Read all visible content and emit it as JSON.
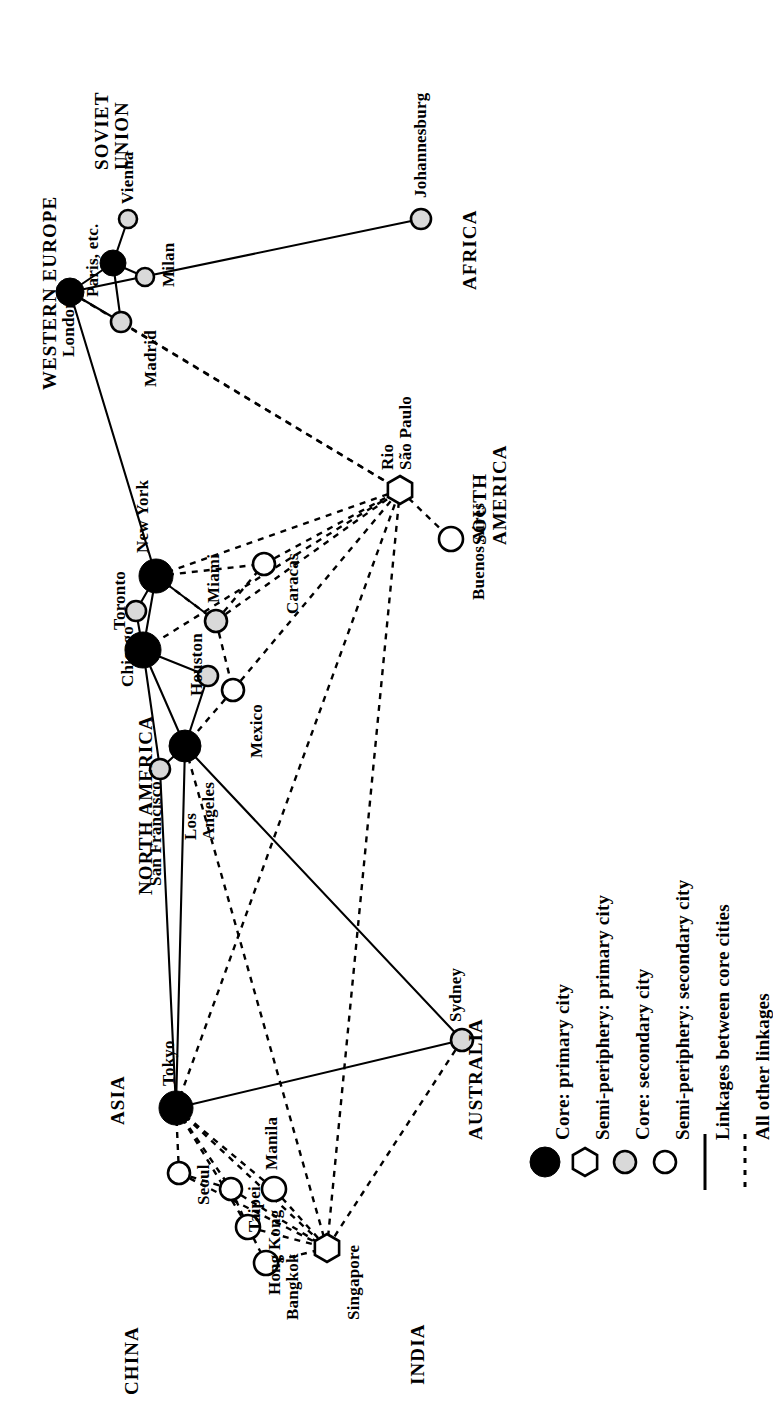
{
  "figure": {
    "type": "network-map",
    "orientation": "rotated-90-ccw",
    "background": "#ffffff",
    "ink": "#000000",
    "fill_secondary": "#d9d9d9"
  },
  "legend": {
    "items": [
      {
        "symbol": "filled-circle",
        "label": "Core: primary city"
      },
      {
        "symbol": "hexagon",
        "label": "Semi-periphery: primary city"
      },
      {
        "symbol": "shaded-circle",
        "label": "Core: secondary city"
      },
      {
        "symbol": "open-circle",
        "label": "Semi-periphery: secondary city"
      },
      {
        "symbol": "solid-line",
        "label": "Linkages between core cities"
      },
      {
        "symbol": "dashed-line",
        "label": "All other linkages"
      }
    ]
  },
  "regions": [
    {
      "id": "western-europe",
      "label": "WESTERN EUROPE",
      "x": 40,
      "y": 390
    },
    {
      "id": "soviet-union",
      "label": "SOVIET\nUNION",
      "x": 92,
      "y": 170
    },
    {
      "id": "africa",
      "label": "AFRICA",
      "x": 460,
      "y": 290
    },
    {
      "id": "south-america",
      "label": "SOUTH\nAMERICA",
      "x": 470,
      "y": 545
    },
    {
      "id": "north-america",
      "label": "NORTH AMERICA",
      "x": 136,
      "y": 895
    },
    {
      "id": "asia",
      "label": "ASIA",
      "x": 108,
      "y": 1125
    },
    {
      "id": "australia",
      "label": "AUSTRALIA",
      "x": 466,
      "y": 1140
    },
    {
      "id": "china",
      "label": "CHINA",
      "x": 122,
      "y": 1395
    },
    {
      "id": "india",
      "label": "INDIA",
      "x": 408,
      "y": 1385
    }
  ],
  "cities": [
    {
      "id": "london",
      "label": "London",
      "type": "filled-circle",
      "r": 14,
      "x": 70,
      "y": 292,
      "lx": 60,
      "ly": 357
    },
    {
      "id": "paris",
      "label": "Paris, etc.",
      "type": "filled-circle",
      "r": 13,
      "x": 113,
      "y": 263,
      "lx": 84,
      "ly": 297
    },
    {
      "id": "vienna",
      "label": "Vienna",
      "type": "shaded-circle",
      "r": 9,
      "x": 128,
      "y": 219,
      "lx": 119,
      "ly": 204
    },
    {
      "id": "milan",
      "label": "Milan",
      "type": "shaded-circle",
      "r": 9,
      "x": 145,
      "y": 277,
      "lx": 160,
      "ly": 287
    },
    {
      "id": "madrid",
      "label": "Madrid",
      "type": "shaded-circle",
      "r": 10,
      "x": 121,
      "y": 322,
      "lx": 142,
      "ly": 387
    },
    {
      "id": "johannesburg",
      "label": "Johannesburg",
      "type": "shaded-circle",
      "r": 10,
      "x": 421,
      "y": 219,
      "lx": 412,
      "ly": 198
    },
    {
      "id": "new-york",
      "label": "New York",
      "type": "filled-circle",
      "r": 17,
      "x": 156,
      "y": 576,
      "lx": 134,
      "ly": 553
    },
    {
      "id": "toronto",
      "label": "Toronto",
      "type": "shaded-circle",
      "r": 10,
      "x": 136,
      "y": 611,
      "lx": 111,
      "ly": 630
    },
    {
      "id": "chicago",
      "label": "Chicago",
      "type": "filled-circle",
      "r": 18,
      "x": 143,
      "y": 650,
      "lx": 119,
      "ly": 687
    },
    {
      "id": "miami",
      "label": "Miami",
      "type": "shaded-circle",
      "r": 11,
      "x": 216,
      "y": 621,
      "lx": 205,
      "ly": 603
    },
    {
      "id": "caracas",
      "label": "Caracas",
      "type": "open-circle",
      "r": 11,
      "x": 264,
      "y": 564,
      "lx": 284,
      "ly": 614
    },
    {
      "id": "houston",
      "label": "Houston",
      "type": "shaded-circle",
      "r": 10,
      "x": 208,
      "y": 676,
      "lx": 188,
      "ly": 696
    },
    {
      "id": "mexico",
      "label": "Mexico",
      "type": "open-circle",
      "r": 11,
      "x": 233,
      "y": 690,
      "lx": 248,
      "ly": 758
    },
    {
      "id": "los-angeles",
      "label": "Los\nAngeles",
      "type": "filled-circle",
      "r": 16,
      "x": 185,
      "y": 746,
      "lx": 182,
      "ly": 840
    },
    {
      "id": "san-francisco",
      "label": "San Francisco",
      "type": "shaded-circle",
      "r": 10,
      "x": 160,
      "y": 769,
      "lx": 147,
      "ly": 886
    },
    {
      "id": "rio-sao-paulo",
      "label": "Rio\nSão Paulo",
      "type": "hexagon",
      "r": 14,
      "x": 400,
      "y": 490,
      "lx": 379,
      "ly": 470
    },
    {
      "id": "buenos-aires",
      "label": "Buenos Aires",
      "type": "open-circle",
      "r": 12,
      "x": 451,
      "y": 539,
      "lx": 470,
      "ly": 600
    },
    {
      "id": "tokyo",
      "label": "Tokyo",
      "type": "filled-circle",
      "r": 17,
      "x": 176,
      "y": 1108,
      "lx": 160,
      "ly": 1086
    },
    {
      "id": "seoul",
      "label": "Seoul",
      "type": "open-circle",
      "r": 11,
      "x": 179,
      "y": 1173,
      "lx": 195,
      "ly": 1205
    },
    {
      "id": "taipei",
      "label": "Taipei",
      "type": "open-circle",
      "r": 11,
      "x": 231,
      "y": 1189,
      "lx": 246,
      "ly": 1232
    },
    {
      "id": "manila",
      "label": "Manila",
      "type": "open-circle",
      "r": 12,
      "x": 274,
      "y": 1189,
      "lx": 263,
      "ly": 1170
    },
    {
      "id": "hong-kong",
      "label": "Hong Kong",
      "type": "open-circle",
      "r": 12,
      "x": 248,
      "y": 1227,
      "lx": 266,
      "ly": 1295
    },
    {
      "id": "bangkok",
      "label": "Bangkok",
      "type": "open-circle",
      "r": 12,
      "x": 266,
      "y": 1263,
      "lx": 284,
      "ly": 1320
    },
    {
      "id": "singapore",
      "label": "Singapore",
      "type": "hexagon",
      "r": 14,
      "x": 327,
      "y": 1248,
      "lx": 345,
      "ly": 1320
    },
    {
      "id": "sydney",
      "label": "Sydney",
      "type": "shaded-circle",
      "r": 11,
      "x": 462,
      "y": 1040,
      "lx": 447,
      "ly": 1022
    }
  ],
  "links_solid": [
    [
      "london",
      "paris"
    ],
    [
      "london",
      "madrid"
    ],
    [
      "paris",
      "vienna"
    ],
    [
      "paris",
      "milan"
    ],
    [
      "paris",
      "madrid"
    ],
    [
      "london",
      "johannesburg"
    ],
    [
      "london",
      "new-york"
    ],
    [
      "new-york",
      "toronto"
    ],
    [
      "new-york",
      "chicago"
    ],
    [
      "new-york",
      "miami"
    ],
    [
      "toronto",
      "chicago"
    ],
    [
      "chicago",
      "houston"
    ],
    [
      "chicago",
      "los-angeles"
    ],
    [
      "chicago",
      "san-francisco"
    ],
    [
      "houston",
      "los-angeles"
    ],
    [
      "los-angeles",
      "san-francisco"
    ],
    [
      "los-angeles",
      "tokyo"
    ],
    [
      "san-francisco",
      "tokyo"
    ],
    [
      "los-angeles",
      "sydney"
    ],
    [
      "tokyo",
      "sydney"
    ]
  ],
  "links_dashed": [
    [
      "madrid",
      "rio-sao-paulo"
    ],
    [
      "london",
      "rio-sao-paulo"
    ],
    [
      "new-york",
      "rio-sao-paulo"
    ],
    [
      "new-york",
      "miami"
    ],
    [
      "new-york",
      "caracas"
    ],
    [
      "miami",
      "caracas"
    ],
    [
      "miami",
      "mexico"
    ],
    [
      "miami",
      "rio-sao-paulo"
    ],
    [
      "mexico",
      "rio-sao-paulo"
    ],
    [
      "mexico",
      "los-angeles"
    ],
    [
      "caracas",
      "rio-sao-paulo"
    ],
    [
      "rio-sao-paulo",
      "buenos-aires"
    ],
    [
      "rio-sao-paulo",
      "singapore"
    ],
    [
      "los-angeles",
      "singapore"
    ],
    [
      "tokyo",
      "seoul"
    ],
    [
      "tokyo",
      "taipei"
    ],
    [
      "tokyo",
      "hong-kong"
    ],
    [
      "tokyo",
      "manila"
    ],
    [
      "tokyo",
      "singapore"
    ],
    [
      "seoul",
      "taipei"
    ],
    [
      "seoul",
      "singapore"
    ],
    [
      "taipei",
      "hong-kong"
    ],
    [
      "taipei",
      "singapore"
    ],
    [
      "hong-kong",
      "bangkok"
    ],
    [
      "hong-kong",
      "singapore"
    ],
    [
      "bangkok",
      "singapore"
    ],
    [
      "manila",
      "singapore"
    ],
    [
      "sydney",
      "singapore"
    ],
    [
      "chicago",
      "rio-sao-paulo"
    ],
    [
      "tokyo",
      "rio-sao-paulo"
    ]
  ]
}
